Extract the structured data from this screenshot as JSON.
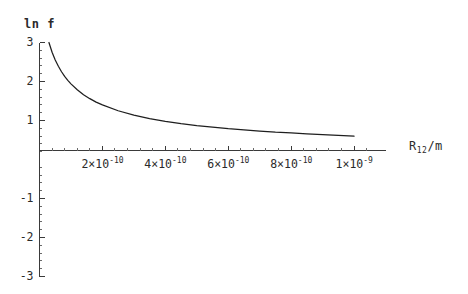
{
  "chart_data": {
    "type": "line",
    "title": "",
    "xlabel": "R12/m",
    "ylabel": "ln f",
    "xlim": [
      0,
      1.1e-09
    ],
    "ylim": [
      -3,
      3
    ],
    "grid": false,
    "legend": null,
    "x_tick_labels": [
      {
        "mantissa": "2",
        "times": "×",
        "base": "10",
        "exponent": "-10",
        "value": 2e-10
      },
      {
        "mantissa": "4",
        "times": "×",
        "base": "10",
        "exponent": "-10",
        "value": 4e-10
      },
      {
        "mantissa": "6",
        "times": "×",
        "base": "10",
        "exponent": "-10",
        "value": 6e-10
      },
      {
        "mantissa": "8",
        "times": "×",
        "base": "10",
        "exponent": "-10",
        "value": 8e-10
      },
      {
        "mantissa": "1",
        "times": "×",
        "base": "10",
        "exponent": "-9",
        "value": 1e-09
      }
    ],
    "y_tick_labels": [
      {
        "text": "3",
        "value": 3
      },
      {
        "text": "2",
        "value": 2
      },
      {
        "text": "1",
        "value": 1
      },
      {
        "text": "-1",
        "value": -1
      },
      {
        "text": "-2",
        "value": -2
      },
      {
        "text": "-3",
        "value": -3
      }
    ],
    "series": [
      {
        "name": "ln f",
        "x": [
          3e-11,
          4e-11,
          5e-11,
          6e-11,
          7e-11,
          8e-11,
          9e-11,
          1e-10,
          1.2e-10,
          1.4e-10,
          1.6e-10,
          1.8e-10,
          2e-10,
          2.5e-10,
          3e-10,
          3.5e-10,
          4e-10,
          4.5e-10,
          5e-10,
          5.5e-10,
          6e-10,
          6.5e-10,
          7e-10,
          7.5e-10,
          8e-10,
          8.5e-10,
          9e-10,
          9.5e-10,
          1e-09
        ],
        "y": [
          3.0,
          2.75,
          2.55,
          2.39,
          2.25,
          2.13,
          2.03,
          1.94,
          1.79,
          1.66,
          1.56,
          1.47,
          1.4,
          1.25,
          1.14,
          1.05,
          0.98,
          0.92,
          0.87,
          0.83,
          0.79,
          0.76,
          0.73,
          0.7,
          0.68,
          0.66,
          0.64,
          0.62,
          0.6
        ],
        "color": "#1e1e1e"
      }
    ]
  },
  "axes": {
    "y_axis_label": "ln  f",
    "x_axis_label_prefix": "R",
    "x_axis_label_sub": "12",
    "x_axis_label_suffix": "/m"
  }
}
